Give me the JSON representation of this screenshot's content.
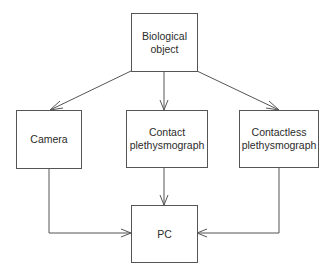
{
  "diagram": {
    "type": "flowchart",
    "line_color": "#555555",
    "text_color": "#2b2b2b",
    "nodes": [
      {
        "id": "bio",
        "label": "Biological\nobject"
      },
      {
        "id": "camera",
        "label": "Camera"
      },
      {
        "id": "contact",
        "label": "Contact\nplethysmograph"
      },
      {
        "id": "contactless",
        "label": "Contactless\nplethysmograph"
      },
      {
        "id": "pc",
        "label": "PC"
      }
    ],
    "edges": [
      {
        "from": "bio",
        "to": "camera"
      },
      {
        "from": "bio",
        "to": "contact"
      },
      {
        "from": "bio",
        "to": "contactless"
      },
      {
        "from": "camera",
        "to": "pc"
      },
      {
        "from": "contact",
        "to": "pc"
      },
      {
        "from": "contactless",
        "to": "pc"
      }
    ]
  }
}
